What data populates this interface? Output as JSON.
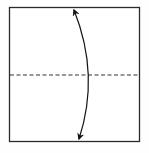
{
  "diagram": {
    "type": "origami-fold-step",
    "paper": {
      "x": 9,
      "y": 7,
      "width": 130,
      "height": 135,
      "stroke": "#2b2b2b",
      "fill": "#ffffff"
    },
    "fold_line": {
      "kind": "valley-fold",
      "style": "dashed",
      "y": 75,
      "x1": 9,
      "x2": 139,
      "stroke": "#333333"
    },
    "arrow": {
      "kind": "fold-arrow",
      "direction": "double-headed",
      "start": [
        73,
        8
      ],
      "end": [
        79,
        141
      ],
      "bulge": [
        89,
        75
      ],
      "stroke": "#111111"
    },
    "colors": {
      "background": "#fefefe",
      "line": "#2b2b2b"
    }
  }
}
